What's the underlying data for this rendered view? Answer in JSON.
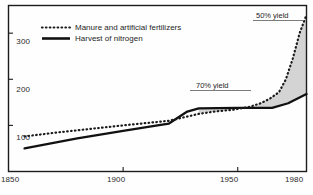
{
  "chart_data": {
    "type": "line",
    "title": "",
    "subtitle": "",
    "xlabel": "",
    "ylabel": "",
    "xlim": [
      1850,
      1980
    ],
    "ylim": [
      0,
      360
    ],
    "grid": false,
    "legend_position": "top-left",
    "x_ticks": [
      1850,
      1900,
      1950,
      1980
    ],
    "x_tick_labels": [
      "1850",
      "1900",
      "1950",
      "1980"
    ],
    "y_ticks": [
      100,
      200,
      300
    ],
    "y_tick_labels": [
      "100",
      "200",
      "300"
    ],
    "series": [
      {
        "name": "Manure and artificial fertilizers",
        "style": "dotted",
        "color": "#1a1a1a",
        "x": [
          1857,
          1870,
          1885,
          1900,
          1912,
          1920,
          1927,
          1933,
          1940,
          1948,
          1955,
          1960,
          1964,
          1968,
          1971,
          1974,
          1977,
          1980
        ],
        "values": [
          76,
          84,
          92,
          100,
          106,
          110,
          118,
          125,
          130,
          134,
          140,
          148,
          158,
          172,
          200,
          245,
          300,
          340
        ]
      },
      {
        "name": "Harvest of nitrogen",
        "style": "solid",
        "color": "#111111",
        "x": [
          1857,
          1880,
          1900,
          1915,
          1920,
          1928,
          1933,
          1950,
          1965,
          1972,
          1980
        ],
        "values": [
          50,
          72,
          88,
          100,
          104,
          130,
          137,
          138,
          138,
          148,
          168
        ]
      }
    ],
    "shaded_region": {
      "label": "gap between fertilizer input and nitrogen harvest",
      "color": "#d0d0d0",
      "between": [
        "Manure and artificial fertilizers",
        "Harvest of nitrogen"
      ],
      "x_from": 1933,
      "x_to": 1980
    },
    "annotations": [
      {
        "text": "50% yield",
        "x": 1972,
        "y": 352,
        "rule": true
      },
      {
        "text": "70% yield",
        "x": 1957,
        "y": 212,
        "rule": true
      }
    ]
  },
  "legend": {
    "items": [
      {
        "label": "Manure and artificial fertilizers",
        "marker": "dotted-line-swatch"
      },
      {
        "label": "Harvest of nitrogen",
        "marker": "solid-line-swatch"
      }
    ]
  },
  "axes": {
    "y_labels": [
      "300",
      "200",
      "100"
    ],
    "x_labels": [
      "1850",
      "1900",
      "1950",
      "1980"
    ]
  },
  "annotations": {
    "top": "50% yield",
    "mid": "70% yield"
  },
  "colors": {
    "frame": "#1a1a1a",
    "series_primary": "#111111",
    "series_secondary": "#1a1a1a",
    "shade": "#d0d0d0",
    "background": "#fefefe"
  }
}
